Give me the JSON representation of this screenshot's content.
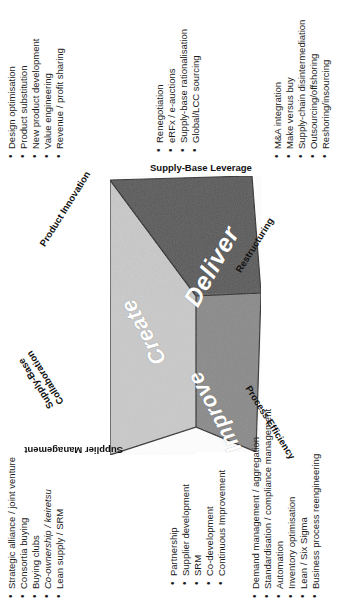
{
  "diagram": {
    "faces": [
      {
        "id": "create",
        "label": "Create",
        "color": "#c9c9c9"
      },
      {
        "id": "deliver",
        "label": "Deliver",
        "color": "#595959"
      },
      {
        "id": "improve",
        "label": "Improve",
        "color": "#8a8a8a"
      }
    ],
    "edges": {
      "top": "Supply-Base Leverage",
      "upper_left": "Product Innovation",
      "upper_right": "Restructuring",
      "lower_left": "Supply-Base\nCollaboration",
      "lower_left_line1": "Supply-Base",
      "lower_left_line2": "Collaboration",
      "lower_right": "Process Efficiency",
      "bottom": "Supplier Management"
    },
    "lists": {
      "product_innovation": [
        "Design optimisation",
        "Product substitution",
        "New product development",
        "Value engineering",
        "Revenue / profit sharing"
      ],
      "supply_base_leverage": [
        "Renegotiation",
        "eRFx / e-auctions",
        "Supply-base rationalisation",
        "Global/LCC sourcing"
      ],
      "restructuring": [
        "M&A integration",
        "Make versus buy",
        "Supply-chain disintermediation",
        "Outsourcing/offshoring",
        "Reshoring/insourcing"
      ],
      "supply_base_collaboration": [
        "Strategic alliance / joint venture",
        "Consortia buying",
        "Buying clubs",
        "Co-ownership / keiretsu",
        "Lean supply / SRM"
      ],
      "supplier_management": [
        "Partnership",
        "Supplier development",
        "SRM",
        "Co-development",
        "Continuous Improvement"
      ],
      "process_efficiency": [
        "Demand management / aggregation",
        "Standardisation / compliance management",
        "Automation",
        "Inventory optimisation",
        "Lean / Six Sigma",
        "Business process reengineering"
      ]
    },
    "colors": {
      "face_create": "#c9c9c9",
      "face_deliver": "#595959",
      "face_improve": "#8a8a8a",
      "outline": "#2b2b2b",
      "text": "#1a1a1a",
      "face_text": "#ffffff",
      "background": "#ffffff"
    }
  }
}
